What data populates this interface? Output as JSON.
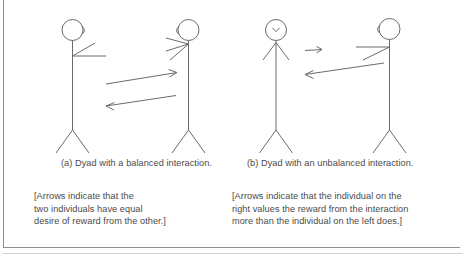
{
  "figure": {
    "type": "two-panel-line-drawing",
    "stroke_color": "#6b6b6b",
    "text_color": "#4a4a4a",
    "background_color": "#ffffff",
    "width": 463,
    "height": 254
  },
  "panels": [
    {
      "id": "a",
      "caption": "(a) Dyad with a balanced interaction.",
      "note_lines": [
        "[Arrows indicate that the",
        "two individuals have equal",
        "desire of reward from the other.]"
      ],
      "note_text": "[Arrows indicate that the two individuals have equal desire of reward from the other.]",
      "figures": [
        {
          "name": "left-person",
          "facing": "right",
          "arms": "raised-toward-partner"
        },
        {
          "name": "right-person",
          "facing": "left",
          "arms": "raised-toward-partner"
        }
      ],
      "arrows": [
        {
          "name": "arrow-left-to-right",
          "direction": "right",
          "length": "long"
        },
        {
          "name": "arrow-right-to-left",
          "direction": "left",
          "length": "long"
        }
      ]
    },
    {
      "id": "b",
      "caption": "(b) Dyad with an unbalanced interaction.",
      "note_lines": [
        "[Arrows indicate that the individual on the",
        "right values the reward from the interaction",
        "more than the individual on the left does.]"
      ],
      "note_text": "[Arrows indicate that the individual on the right values the reward from the interaction more than the individual on the left does.]",
      "figures": [
        {
          "name": "left-person",
          "facing": "front",
          "arms": "lowered-neutral"
        },
        {
          "name": "right-person",
          "facing": "left",
          "arms": "raised-toward-partner"
        }
      ],
      "arrows": [
        {
          "name": "arrow-left-to-right",
          "direction": "right",
          "length": "short"
        },
        {
          "name": "arrow-right-to-left",
          "direction": "left",
          "length": "long"
        }
      ]
    }
  ]
}
